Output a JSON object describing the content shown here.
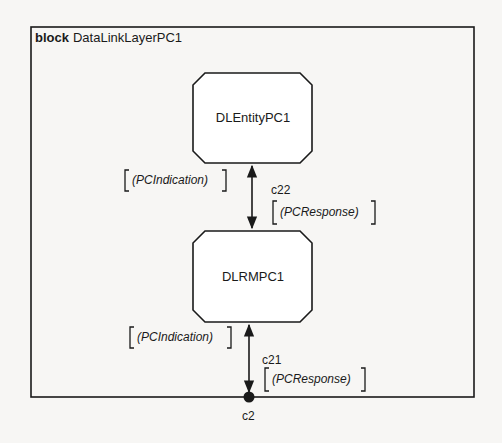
{
  "frame": {
    "keyword": "block",
    "name": "DataLinkLayerPC1"
  },
  "blocks": [
    {
      "name": "DLEntityPC1"
    },
    {
      "name": "DLRMPC1"
    }
  ],
  "channels": [
    {
      "name": "c22",
      "signal_up": "(PCIndication)",
      "signal_down": "(PCResponse)"
    },
    {
      "name": "c21",
      "signal_up": "(PCIndication)",
      "signal_down": "(PCResponse)"
    }
  ],
  "gate": {
    "name": "c2"
  },
  "colors": {
    "line": "#1a1a1a",
    "background": "#f7f6f4"
  }
}
